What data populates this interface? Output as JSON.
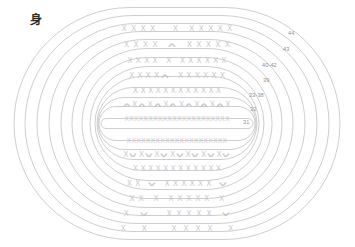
{
  "chart": {
    "title_char": "身",
    "title_meaning": "body",
    "type": "crochet-round-chart",
    "symbol_legend": {
      "x": "X",
      "decrease": "∧",
      "increase": "∨"
    },
    "stroke_color": "#b9b9bd",
    "symbol_color": "#c8c8cd",
    "label_color": "#8f8f95",
    "background": "#ffffff"
  },
  "round_labels": [
    {
      "text": "44",
      "x": 288,
      "y": 30
    },
    {
      "text": "43",
      "x": 283,
      "y": 46
    },
    {
      "text": "40-42",
      "x": 262,
      "y": 62
    },
    {
      "text": "39",
      "x": 263,
      "y": 77
    },
    {
      "text": "33-38",
      "x": 249,
      "y": 92
    },
    {
      "text": "32",
      "x": 250,
      "y": 106
    },
    {
      "text": "31",
      "x": 243,
      "y": 119
    }
  ],
  "rows": [
    {
      "id": "row-44",
      "y": 24,
      "width": 150,
      "gap": 4.6,
      "symbols": [
        "X",
        "X",
        "X",
        "X",
        " ",
        " ",
        "X",
        " ",
        "X",
        "X",
        "X",
        "X",
        "X"
      ]
    },
    {
      "id": "row-43",
      "y": 40,
      "width": 150,
      "gap": 4.6,
      "symbols": [
        "X",
        "X",
        "X",
        "X",
        " ",
        "∧",
        " ",
        "X",
        "X",
        "X",
        "X",
        "X"
      ]
    },
    {
      "id": "row-40-42",
      "y": 56,
      "width": 152,
      "gap": 3.4,
      "symbols": [
        "X",
        "X",
        "X",
        "X",
        " ",
        "X",
        " ",
        "X",
        "X",
        "X",
        "X",
        "X",
        "X"
      ]
    },
    {
      "id": "row-39",
      "y": 71,
      "width": 152,
      "gap": 3.4,
      "symbols": [
        "X",
        "X",
        "X",
        "X",
        "∧",
        " ",
        "X",
        "X",
        "X",
        "X",
        "X",
        "X"
      ]
    },
    {
      "id": "row-33-38",
      "y": 86,
      "width": 154,
      "gap": 2.6,
      "symbols": [
        "X",
        "X",
        "X",
        "X",
        "X",
        "X",
        "X",
        "X",
        "X",
        "X",
        "X",
        "X"
      ]
    },
    {
      "id": "row-32",
      "y": 100,
      "width": 156,
      "gap": 1.8,
      "symbols": [
        "∧",
        "X",
        "∧",
        "X",
        "∧",
        "X",
        "∧",
        "X",
        "∧",
        "X",
        "∧",
        "X",
        "∧",
        "X"
      ]
    },
    {
      "id": "row-31",
      "y": 114,
      "width": 158,
      "gap": 0.4,
      "dense": true,
      "symbols": [
        "X",
        "X",
        "X",
        "X",
        "X",
        "X",
        "X",
        "X",
        "X",
        "X",
        "X",
        "X",
        "X",
        "X",
        "X",
        "X",
        "X",
        "X",
        "X",
        "X",
        "X",
        "X"
      ]
    },
    {
      "id": "row-center-lower",
      "y": 136,
      "width": 158,
      "gap": 0.4,
      "dense": true,
      "symbols": [
        "X",
        "X",
        "X",
        "X",
        "X",
        "X",
        "X",
        "X",
        "X",
        "X",
        "X",
        "X",
        "X",
        "X",
        "X",
        "X",
        "X",
        "X",
        "X",
        "X",
        "X"
      ]
    },
    {
      "id": "row-inc-a",
      "y": 150,
      "width": 156,
      "gap": 1.8,
      "symbols": [
        "X",
        "∨",
        "X",
        "∨",
        "X",
        "∨",
        "X",
        "∨",
        "X",
        "∨",
        "X",
        "∨",
        "X",
        "∨"
      ]
    },
    {
      "id": "row-plain-a",
      "y": 164,
      "width": 154,
      "gap": 2.6,
      "symbols": [
        "X",
        "X",
        "X",
        "X",
        "X",
        "X",
        "X",
        "X",
        "X",
        "X",
        "X",
        "X"
      ]
    },
    {
      "id": "row-inc-b",
      "y": 179,
      "width": 152,
      "gap": 3.4,
      "symbols": [
        "X",
        "X",
        " ",
        "∨",
        " ",
        "X",
        "X",
        "X",
        "X",
        "X",
        "X",
        " ",
        "∨"
      ]
    },
    {
      "id": "row-plain-b",
      "y": 194,
      "width": 150,
      "gap": 4.0,
      "symbols": [
        "X",
        "X",
        " ",
        "X",
        " ",
        "X",
        "X",
        "X",
        "X",
        "X",
        " ",
        "X"
      ]
    },
    {
      "id": "row-inc-c",
      "y": 209,
      "width": 148,
      "gap": 5.0,
      "symbols": [
        "X",
        " ",
        "∨",
        " ",
        " ",
        "X",
        "X",
        "X",
        "X",
        "X",
        " ",
        "∨"
      ]
    },
    {
      "id": "row-sparse",
      "y": 224,
      "width": 144,
      "gap": 7.0,
      "symbols": [
        "X",
        " ",
        "X",
        " ",
        " ",
        "X",
        "X",
        "X",
        "X",
        " ",
        "X"
      ]
    }
  ],
  "rings": [
    {
      "id": "ring-1",
      "cx": 177,
      "cy": 123.5,
      "rx": 163,
      "ry": 116
    },
    {
      "id": "ring-2",
      "cx": 177,
      "cy": 123.5,
      "rx": 152,
      "ry": 108
    },
    {
      "id": "ring-3",
      "cx": 177,
      "cy": 123.5,
      "rx": 140,
      "ry": 100
    },
    {
      "id": "ring-4",
      "cx": 177,
      "cy": 123.5,
      "rx": 128,
      "ry": 92
    },
    {
      "id": "ring-5",
      "cx": 177,
      "cy": 123.5,
      "rx": 116,
      "ry": 84
    },
    {
      "id": "ring-6",
      "cx": 177,
      "cy": 123.5,
      "rx": 105,
      "ry": 75
    },
    {
      "id": "ring-7",
      "cx": 177,
      "cy": 123.5,
      "rx": 95,
      "ry": 66
    },
    {
      "id": "ring-8",
      "cx": 177,
      "cy": 123.5,
      "rx": 87,
      "ry": 57
    },
    {
      "id": "ring-9",
      "cx": 177,
      "cy": 123.5,
      "rx": 82,
      "ry": 47
    },
    {
      "id": "ring-10",
      "cx": 177,
      "cy": 123.5,
      "rx": 80,
      "ry": 36
    },
    {
      "id": "ring-11",
      "cx": 177,
      "cy": 123.5,
      "rx": 79,
      "ry": 26
    },
    {
      "id": "ring-12",
      "cx": 177,
      "cy": 123.5,
      "rx": 78,
      "ry": 17
    },
    {
      "id": "ring-core",
      "cx": 177,
      "cy": 123.5,
      "rx": 76,
      "ry": 5
    }
  ],
  "title_position": {
    "x": 30,
    "y": 14
  }
}
